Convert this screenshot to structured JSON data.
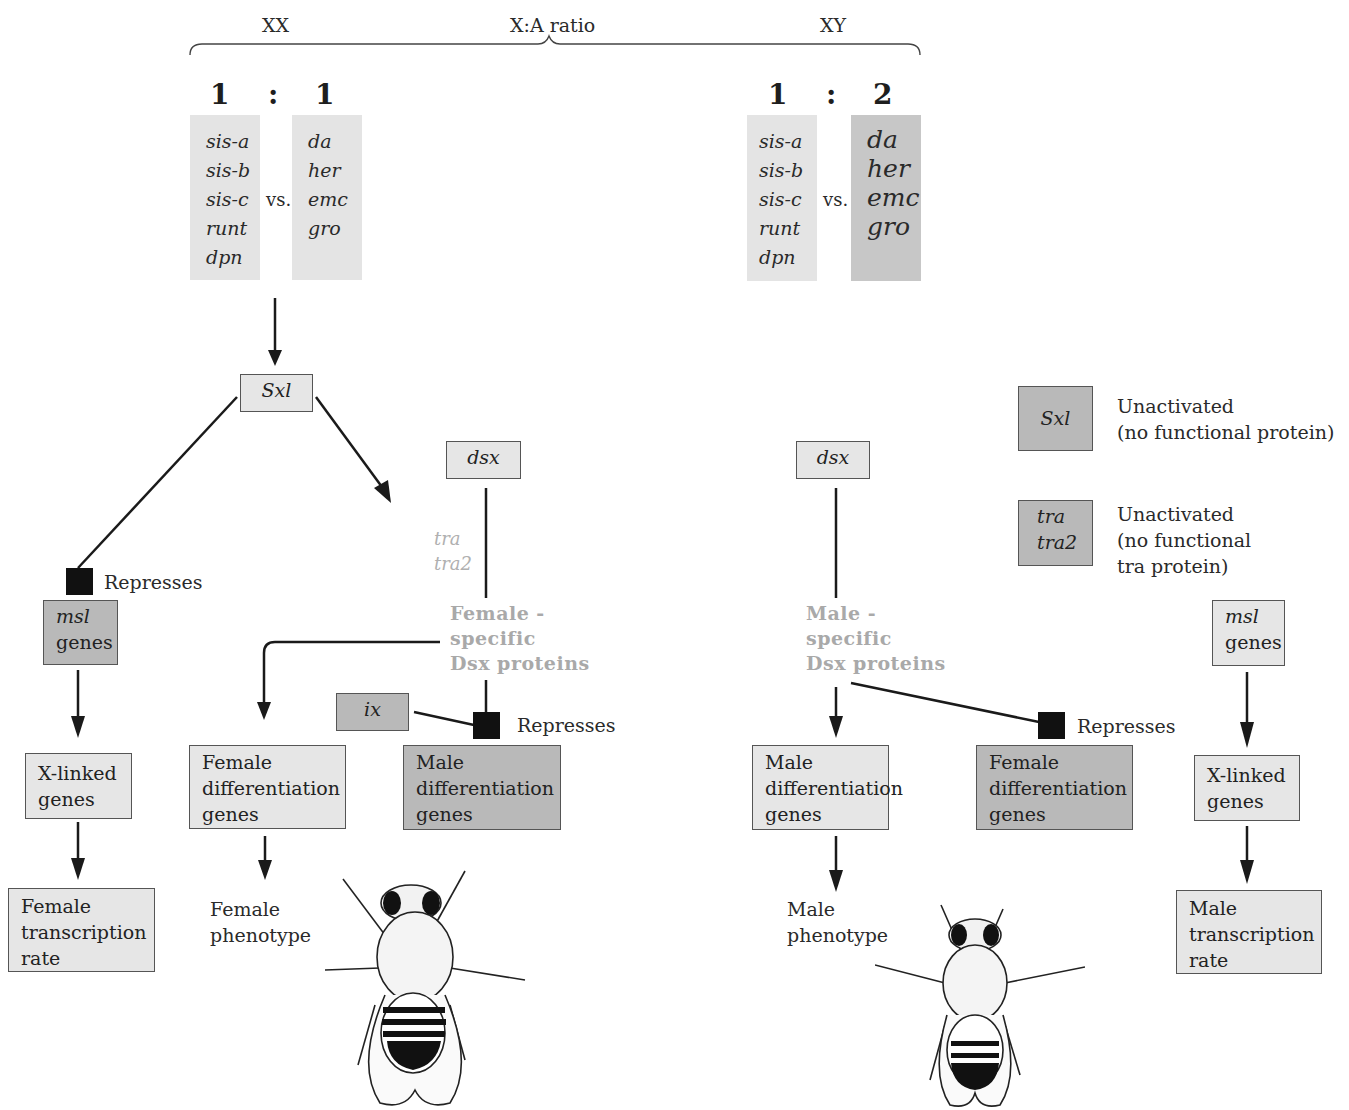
{
  "header": {
    "xx_label": "XX",
    "ratio_label": "X:A ratio",
    "xy_label": "XY"
  },
  "female_ratio": {
    "left": "1",
    "sep": ":",
    "right": "1"
  },
  "male_ratio": {
    "left": "1",
    "sep": ":",
    "right": "2"
  },
  "numerator_genes": [
    "sis-a",
    "sis-b",
    "sis-c",
    "runt",
    "dpn"
  ],
  "denominator_genes": [
    "da",
    "her",
    "emc",
    "gro"
  ],
  "vs_label": "vs.",
  "female_path": {
    "sxl": "Sxl",
    "dsx": "dsx",
    "tra_labels": [
      "tra",
      "tra2"
    ],
    "female_dsx_protein": [
      "Female -",
      "specific",
      "Dsx proteins"
    ],
    "represses_1": "Represses",
    "msl_genes": {
      "line1": "msl",
      "line2": "genes"
    },
    "x_linked_genes": [
      "X-linked",
      "genes"
    ],
    "female_transcription_rate": [
      "Female",
      "transcription",
      "rate"
    ],
    "female_diff_genes": [
      "Female",
      "differentiation",
      "genes"
    ],
    "female_phenotype": [
      "Female",
      "phenotype"
    ],
    "ix": "ix",
    "represses_2": "Represses",
    "male_diff_genes": [
      "Male",
      "differentiation",
      "genes"
    ]
  },
  "male_path": {
    "dsx": "dsx",
    "male_dsx_protein": [
      "Male -",
      "specific",
      "Dsx proteins"
    ],
    "male_diff_genes": [
      "Male",
      "differentiation",
      "genes"
    ],
    "represses": "Represses",
    "female_diff_genes": [
      "Female",
      "differentiation",
      "genes"
    ],
    "male_phenotype": [
      "Male",
      "phenotype"
    ],
    "msl_genes": {
      "line1": "msl",
      "line2": "genes"
    },
    "x_linked_genes": [
      "X-linked",
      "genes"
    ],
    "male_transcription_rate": [
      "Male",
      "transcription",
      "rate"
    ]
  },
  "legend": {
    "sxl": {
      "box": "Sxl",
      "text": [
        "Unactivated",
        "(no functional protein)"
      ]
    },
    "tra": {
      "box": [
        "tra",
        "tra2"
      ],
      "text": [
        "Unactivated",
        "(no functional",
        "tra protein)"
      ]
    }
  },
  "colors": {
    "light_box": "#e6e6e6",
    "dark_box": "#b9b9b9",
    "repress_square": "#111111",
    "gray_text": "#a9a9a9"
  }
}
